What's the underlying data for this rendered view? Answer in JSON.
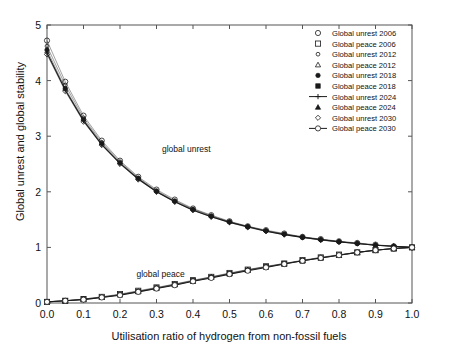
{
  "chart_data": {
    "type": "line",
    "title": "",
    "xlabel": "Utilisation ratio of hydrogen from non-fossil fuels",
    "ylabel": "Global unrest and global stability",
    "xlim": [
      0.0,
      1.0
    ],
    "ylim": [
      0.0,
      5.0
    ],
    "grid": false,
    "legend_position": "top-right",
    "xticks": [
      "0.0",
      "0.1",
      "0.2",
      "0.3",
      "0.4",
      "0.5",
      "0.6",
      "0.7",
      "0.8",
      "0.9",
      "1.0"
    ],
    "xtick_values": [
      0.0,
      0.1,
      0.2,
      0.3,
      0.4,
      0.5,
      0.6,
      0.7,
      0.8,
      0.9,
      1.0
    ],
    "yticks": [
      "0",
      "1",
      "2",
      "3",
      "4",
      "5"
    ],
    "ytick_values": [
      0,
      1,
      2,
      3,
      4,
      5
    ],
    "annotations": [
      {
        "text": "global unrest",
        "x": 0.315,
        "y": 2.72
      },
      {
        "text": "global peace",
        "x": 0.245,
        "y": 0.47
      }
    ],
    "x": [
      0.0,
      0.05,
      0.1,
      0.15,
      0.2,
      0.25,
      0.3,
      0.35,
      0.4,
      0.45,
      0.5,
      0.55,
      0.6,
      0.65,
      0.7,
      0.75,
      0.8,
      0.85,
      0.9,
      0.95,
      1.0
    ],
    "series": [
      {
        "name": "Global unrest 2006",
        "marker": "circle-open",
        "line": false,
        "values": [
          4.72,
          3.98,
          3.37,
          2.92,
          2.56,
          2.27,
          2.04,
          1.86,
          1.7,
          1.58,
          1.47,
          1.38,
          1.31,
          1.25,
          1.19,
          1.15,
          1.11,
          1.08,
          1.05,
          1.02,
          1.0
        ]
      },
      {
        "name": "Global peace 2006",
        "marker": "square-open",
        "line": false,
        "values": [
          0.02,
          0.04,
          0.07,
          0.11,
          0.16,
          0.22,
          0.28,
          0.34,
          0.41,
          0.47,
          0.54,
          0.6,
          0.66,
          0.71,
          0.77,
          0.82,
          0.87,
          0.91,
          0.95,
          0.98,
          1.0
        ]
      },
      {
        "name": "Global unrest 2012",
        "marker": "circle-small",
        "line": false,
        "values": [
          4.62,
          3.92,
          3.33,
          2.89,
          2.54,
          2.25,
          2.02,
          1.84,
          1.69,
          1.57,
          1.46,
          1.38,
          1.3,
          1.24,
          1.19,
          1.14,
          1.11,
          1.07,
          1.04,
          1.02,
          1.0
        ]
      },
      {
        "name": "Global peace 2012",
        "marker": "triangle-open",
        "line": false,
        "values": [
          0.02,
          0.04,
          0.07,
          0.11,
          0.15,
          0.21,
          0.27,
          0.34,
          0.4,
          0.47,
          0.53,
          0.6,
          0.65,
          0.71,
          0.76,
          0.82,
          0.86,
          0.91,
          0.95,
          0.98,
          1.0
        ]
      },
      {
        "name": "Global unrest 2018",
        "marker": "circle-filled",
        "line": false,
        "values": [
          4.55,
          3.86,
          3.3,
          2.87,
          2.52,
          2.24,
          2.01,
          1.83,
          1.68,
          1.56,
          1.46,
          1.37,
          1.3,
          1.24,
          1.18,
          1.14,
          1.1,
          1.07,
          1.04,
          1.02,
          1.0
        ]
      },
      {
        "name": "Global peace 2018",
        "marker": "square-filled",
        "line": false,
        "values": [
          0.02,
          0.04,
          0.07,
          0.1,
          0.15,
          0.21,
          0.27,
          0.33,
          0.4,
          0.46,
          0.53,
          0.59,
          0.65,
          0.71,
          0.76,
          0.81,
          0.86,
          0.91,
          0.95,
          0.98,
          1.0
        ]
      },
      {
        "name": "Global unrest 2024",
        "marker": "plus-line",
        "line": true,
        "values": [
          4.5,
          3.83,
          3.28,
          2.85,
          2.51,
          2.23,
          2.0,
          1.82,
          1.67,
          1.55,
          1.45,
          1.37,
          1.29,
          1.23,
          1.18,
          1.14,
          1.1,
          1.07,
          1.04,
          1.02,
          1.0
        ]
      },
      {
        "name": "Global peace 2024",
        "marker": "triangle-filled",
        "line": false,
        "values": [
          0.02,
          0.04,
          0.06,
          0.1,
          0.15,
          0.2,
          0.26,
          0.33,
          0.39,
          0.46,
          0.52,
          0.59,
          0.65,
          0.7,
          0.76,
          0.81,
          0.86,
          0.91,
          0.95,
          0.98,
          1.0
        ]
      },
      {
        "name": "Global unrest 2030",
        "marker": "diamond-open",
        "line": false,
        "values": [
          4.47,
          3.81,
          3.26,
          2.84,
          2.5,
          2.22,
          2.0,
          1.82,
          1.67,
          1.55,
          1.45,
          1.36,
          1.29,
          1.23,
          1.18,
          1.13,
          1.1,
          1.07,
          1.04,
          1.02,
          1.0
        ]
      },
      {
        "name": "Global peace 2030",
        "marker": "circle-line",
        "line": true,
        "values": [
          0.02,
          0.04,
          0.06,
          0.1,
          0.14,
          0.2,
          0.26,
          0.32,
          0.39,
          0.45,
          0.52,
          0.58,
          0.64,
          0.7,
          0.76,
          0.81,
          0.86,
          0.91,
          0.95,
          0.98,
          1.0
        ]
      }
    ]
  },
  "legend": {
    "items": [
      {
        "label": "Global unrest 2006",
        "marker": "circle-open"
      },
      {
        "label": "Global peace 2006",
        "marker": "square-open"
      },
      {
        "label": "Global unrest 2012",
        "marker": "circle-small"
      },
      {
        "label": "Global peace 2012",
        "marker": "triangle-open"
      },
      {
        "label": "Global unrest 2018",
        "marker": "circle-filled"
      },
      {
        "label": "Global peace 2018",
        "marker": "square-filled"
      },
      {
        "label": "Global unrest 2024",
        "marker": "plus-line"
      },
      {
        "label": "Global peace 2024",
        "marker": "triangle-filled"
      },
      {
        "label": "Global unrest 2030",
        "marker": "diamond-open"
      },
      {
        "label": "Global peace 2030",
        "marker": "circle-line"
      }
    ]
  },
  "colors": {
    "line": "#1a1a1a",
    "axis": "#555555",
    "text": "#111111",
    "background": "#ffffff"
  }
}
